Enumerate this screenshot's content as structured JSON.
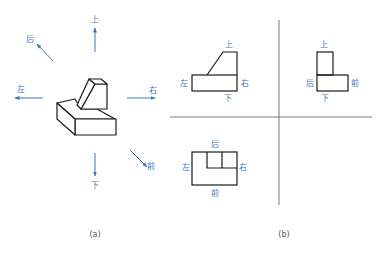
{
  "colors": {
    "label": "#3b78b8",
    "arrow": "#3b78b8",
    "outline": "#1a1a1a",
    "divider": "#555555",
    "caption": "#555555"
  },
  "panel_a": {
    "caption": "(a)",
    "directions": {
      "up": "上",
      "back": "后",
      "left": "左",
      "right": "右",
      "down": "下",
      "front": "前"
    }
  },
  "panel_b": {
    "caption": "(b)",
    "front_view": {
      "top": "上",
      "bottom": "下",
      "left": "左",
      "right": "右"
    },
    "side_view": {
      "top": "上",
      "bottom": "下",
      "left": "后",
      "right": "前"
    },
    "top_view": {
      "top": "后",
      "bottom": "前",
      "left": "左",
      "right": "右"
    }
  }
}
